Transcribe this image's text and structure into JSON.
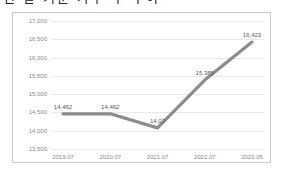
{
  "title": "년 말 기준 가구 수 추이",
  "chart_data": {
    "type": "line",
    "title": "",
    "xlabel": "",
    "ylabel": "",
    "categories": [
      "2019.07",
      "2020.07",
      "2021.07",
      "2022.07",
      "2023.05"
    ],
    "values": [
      14462,
      14462,
      14077,
      15385,
      16423
    ],
    "point_labels": [
      "14,462",
      "14,462",
      "14,07",
      "15,385",
      "16,423"
    ],
    "ylim": [
      13500,
      17000
    ],
    "ytick_values": [
      17000,
      16500,
      16000,
      15500,
      15000,
      14500,
      14000,
      13500
    ],
    "ytick_labels": [
      "17,000",
      "16,500",
      "16,000",
      "15,500",
      "15,000",
      "14,500",
      "14,000",
      "13,500"
    ],
    "grid": true,
    "legend": false,
    "series_color": "#8c8c8c",
    "grid_color": "#e8e8e8",
    "frame_color": "#c9c9c9",
    "label_color": "#8a8a8a"
  }
}
